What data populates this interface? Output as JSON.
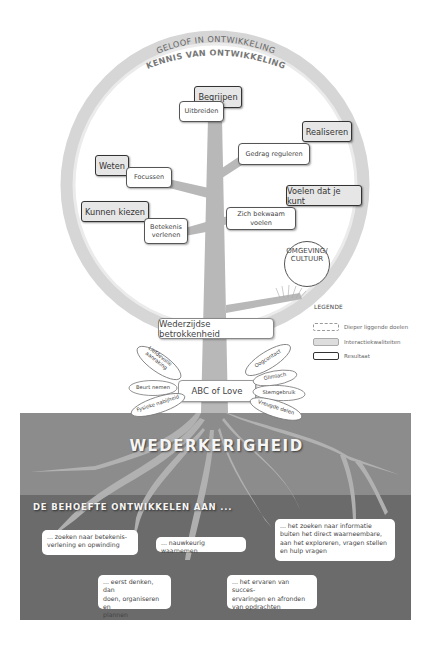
{
  "header": {
    "arc_outer": "GELOOF IN ONTWIKKELING",
    "arc_inner": "KENNIS VAN ONTWIKKELING"
  },
  "tree": {
    "results": [
      {
        "id": "begrijpen",
        "label": "Begrijpen"
      },
      {
        "id": "realiseren",
        "label": "Realiseren"
      },
      {
        "id": "weten",
        "label": "Weten"
      },
      {
        "id": "voelen",
        "label": "Voelen dat je kunt"
      },
      {
        "id": "kunnen-kiezen",
        "label": "Kunnen kiezen"
      }
    ],
    "goals": [
      {
        "id": "uitbreiden",
        "label": "Uitbreiden"
      },
      {
        "id": "gedrag-reguleren",
        "label": "Gedrag reguleren"
      },
      {
        "id": "focussen",
        "label": "Focussen"
      },
      {
        "id": "zich-bekwaam-voelen",
        "label": "Zich bekwaam voelen"
      },
      {
        "id": "betekenis-verlenen",
        "label": "Betekenis\nverlenen"
      }
    ],
    "environment": {
      "line1": "OMGEVING/",
      "line2": "CULTUUR"
    },
    "interaction": "Wederzijdse betrokkenheid",
    "abc": "ABC of Love",
    "leaves_left": [
      "Liefdevolle aanraking",
      "Beurt nemen",
      "Fysieke nabijheid"
    ],
    "leaves_right": [
      "Oogcontact",
      "Glimlach",
      "Stemgebruik",
      "Vreugde delen"
    ]
  },
  "legend": {
    "title": "LEGENDE",
    "items": [
      {
        "label": "Dieper liggende doelen",
        "style": "dashed"
      },
      {
        "label": "Interactiekwaliteiten",
        "style": "gray"
      },
      {
        "label": "Resultaat",
        "style": "bold"
      }
    ]
  },
  "soil": {
    "title": "WEDERKERIGHEID",
    "subtitle": "DE BEHOEFTE ONTWIKKELEN AAN ...",
    "colors": {
      "upper": "#8c8c8c",
      "lower": "#6e6e6e",
      "roots": "#b3b3b3"
    },
    "needs": [
      {
        "id": "betekenis",
        "text": "... zoeken naar betekenis-\nverlening en opwinding"
      },
      {
        "id": "waarnemen",
        "text": "... nauwkeurig waarnemen"
      },
      {
        "id": "informatie",
        "text": "... het zoeken naar informatie\nbuiten het direct waarneembare,\naan het exploreren, vragen stellen\nen hulp vragen"
      },
      {
        "id": "denken",
        "text": "... eerst denken, dan\ndoen, organiseren en\nplannen"
      },
      {
        "id": "succes",
        "text": "... het ervaren van succes-\nervaringen en afronden\nvan opdrachten"
      }
    ]
  }
}
